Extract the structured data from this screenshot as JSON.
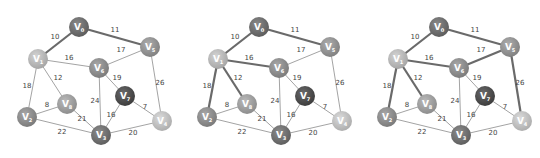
{
  "nodes": [
    {
      "id": "V0",
      "label": "V",
      "sub": "0",
      "x": 79,
      "y": 27,
      "color": "#6c6c6c"
    },
    {
      "id": "V1",
      "label": "V",
      "sub": "1",
      "x": 38,
      "y": 59,
      "color": "#b5b5b5"
    },
    {
      "id": "V2",
      "label": "V",
      "sub": "2",
      "x": 27,
      "y": 117,
      "color": "#8a8a8a"
    },
    {
      "id": "V3",
      "label": "V",
      "sub": "3",
      "x": 101,
      "y": 135,
      "color": "#6e6e6e"
    },
    {
      "id": "V4",
      "label": "V",
      "sub": "4",
      "x": 162,
      "y": 121,
      "color": "#bdbdbd"
    },
    {
      "id": "V5",
      "label": "V",
      "sub": "5",
      "x": 150,
      "y": 47,
      "color": "#909090"
    },
    {
      "id": "V6",
      "label": "V",
      "sub": "6",
      "x": 99,
      "y": 68,
      "color": "#8a8a8a"
    },
    {
      "id": "V7",
      "label": "V",
      "sub": "7",
      "x": 125,
      "y": 96,
      "color": "#4c4c4c"
    },
    {
      "id": "V8",
      "label": "V",
      "sub": "8",
      "x": 67,
      "y": 104,
      "color": "#9c9c9c"
    }
  ],
  "edges": [
    {
      "from": "V0",
      "to": "V1",
      "weight": "10",
      "lx": 55,
      "ly": 39
    },
    {
      "from": "V0",
      "to": "V5",
      "weight": "11",
      "lx": 115,
      "ly": 32
    },
    {
      "from": "V1",
      "to": "V6",
      "weight": "16",
      "lx": 69,
      "ly": 60
    },
    {
      "from": "V6",
      "to": "V5",
      "weight": "17",
      "lx": 121,
      "ly": 52
    },
    {
      "from": "V1",
      "to": "V8",
      "weight": "12",
      "lx": 58,
      "ly": 80
    },
    {
      "from": "V1",
      "to": "V2",
      "weight": "18",
      "lx": 27,
      "ly": 88
    },
    {
      "from": "V2",
      "to": "V8",
      "weight": "8",
      "lx": 47,
      "ly": 107
    },
    {
      "from": "V2",
      "to": "V3",
      "weight": "22",
      "lx": 62,
      "ly": 134
    },
    {
      "from": "V8",
      "to": "V3",
      "weight": "21",
      "lx": 82,
      "ly": 121
    },
    {
      "from": "V6",
      "to": "V3",
      "weight": "24",
      "lx": 95,
      "ly": 103
    },
    {
      "from": "V6",
      "to": "V7",
      "weight": "19",
      "lx": 117,
      "ly": 80
    },
    {
      "from": "V7",
      "to": "V3",
      "weight": "16",
      "lx": 111,
      "ly": 117
    },
    {
      "from": "V7",
      "to": "V4",
      "weight": "7",
      "lx": 145,
      "ly": 109
    },
    {
      "from": "V3",
      "to": "V4",
      "weight": "20",
      "lx": 133,
      "ly": 135
    },
    {
      "from": "V5",
      "to": "V4",
      "weight": "26",
      "lx": 160,
      "ly": 85
    }
  ],
  "panels": [
    {
      "name": "step-1",
      "offset_x": 0,
      "highlighted_edges": [
        "V0-V1",
        "V0-V5"
      ]
    },
    {
      "name": "step-2",
      "offset_x": 180,
      "highlighted_edges": [
        "V0-V1",
        "V0-V5",
        "V1-V6",
        "V1-V2",
        "V1-V8"
      ]
    },
    {
      "name": "step-3",
      "offset_x": 360,
      "highlighted_edges": [
        "V0-V1",
        "V0-V5",
        "V1-V6",
        "V1-V2",
        "V1-V8",
        "V6-V5",
        "V5-V4"
      ]
    }
  ],
  "style": {
    "edge_color": "#8c8c8c",
    "highlight_edge_color": "#6a6a6a",
    "edge_width": 0.8,
    "highlight_edge_width": 2.2,
    "node_radius": 10
  }
}
